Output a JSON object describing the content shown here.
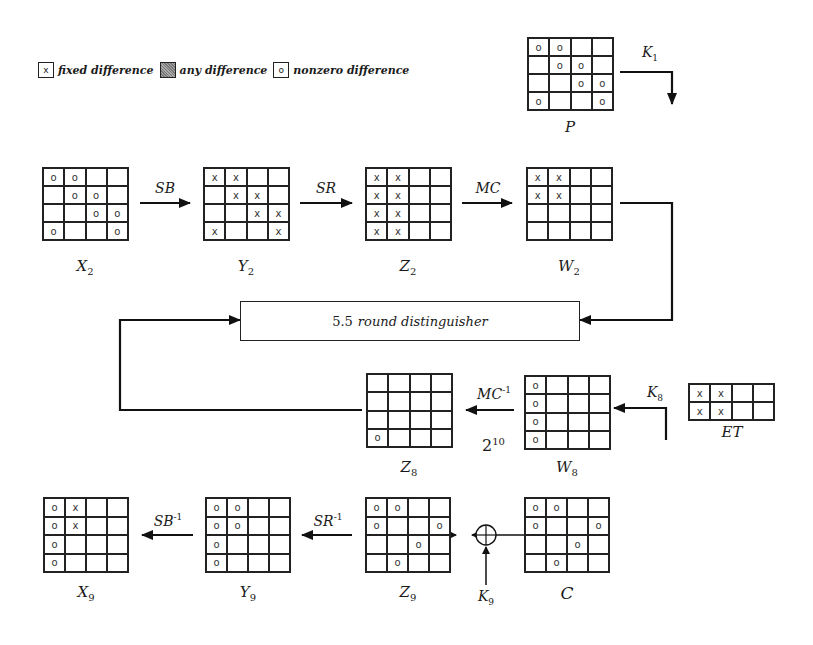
{
  "legend": [
    {
      "symbol": "x",
      "kind": "fixed",
      "label": "fixed difference"
    },
    {
      "symbol": "",
      "kind": "any",
      "label": "any difference"
    },
    {
      "symbol": "o",
      "kind": "nonzero",
      "label": "nonzero difference"
    }
  ],
  "states": {
    "P": {
      "name": "P",
      "sub": "",
      "cells": [
        [
          "o",
          "o",
          "",
          ""
        ],
        [
          "",
          "o",
          "o",
          ""
        ],
        [
          "",
          "",
          "o",
          "o"
        ],
        [
          "o",
          "",
          "",
          "o"
        ]
      ]
    },
    "X2": {
      "name": "X",
      "sub": "2",
      "cells": [
        [
          "o",
          "o",
          "",
          ""
        ],
        [
          "",
          "o",
          "o",
          ""
        ],
        [
          "",
          "",
          "o",
          "o"
        ],
        [
          "o",
          "",
          "",
          "o"
        ]
      ]
    },
    "Y2": {
      "name": "Y",
      "sub": "2",
      "cells": [
        [
          "x",
          "x",
          "",
          ""
        ],
        [
          "",
          "x",
          "x",
          ""
        ],
        [
          "",
          "",
          "x",
          "x"
        ],
        [
          "x",
          "",
          "",
          "x"
        ]
      ]
    },
    "Z2": {
      "name": "Z",
      "sub": "2",
      "cells": [
        [
          "x",
          "x",
          "",
          ""
        ],
        [
          "x",
          "x",
          "",
          ""
        ],
        [
          "x",
          "x",
          "",
          ""
        ],
        [
          "x",
          "x",
          "",
          ""
        ]
      ]
    },
    "W2": {
      "name": "W",
      "sub": "2",
      "cells": [
        [
          "x",
          "x",
          "",
          ""
        ],
        [
          "x",
          "x",
          "",
          ""
        ],
        [
          "",
          "",
          "",
          ""
        ],
        [
          "",
          "",
          "",
          ""
        ]
      ]
    },
    "Z8": {
      "name": "Z",
      "sub": "8",
      "cells": [
        [
          "",
          "",
          "",
          ""
        ],
        [
          "",
          "",
          "",
          ""
        ],
        [
          "",
          "",
          "",
          ""
        ],
        [
          "o",
          "",
          "",
          ""
        ]
      ]
    },
    "W8": {
      "name": "W",
      "sub": "8",
      "cells": [
        [
          "o",
          "",
          "",
          ""
        ],
        [
          "o",
          "",
          "",
          ""
        ],
        [
          "o",
          "",
          "",
          ""
        ],
        [
          "o",
          "",
          "",
          ""
        ]
      ]
    },
    "ET": {
      "name": "ET",
      "sub": "",
      "cells": [
        [
          "x",
          "x",
          "",
          ""
        ],
        [
          "x",
          "x",
          "",
          ""
        ]
      ]
    },
    "X9": {
      "name": "X",
      "sub": "9",
      "cells": [
        [
          "o",
          "x",
          "",
          ""
        ],
        [
          "o",
          "x",
          "",
          ""
        ],
        [
          "o",
          "",
          "",
          ""
        ],
        [
          "o",
          "",
          "",
          ""
        ]
      ]
    },
    "Y9": {
      "name": "Y",
      "sub": "9",
      "cells": [
        [
          "o",
          "o",
          "",
          ""
        ],
        [
          "o",
          "o",
          "",
          ""
        ],
        [
          "o",
          "",
          "",
          ""
        ],
        [
          "o",
          "",
          "",
          ""
        ]
      ]
    },
    "Z9": {
      "name": "Z",
      "sub": "9",
      "cells": [
        [
          "o",
          "o",
          "",
          ""
        ],
        [
          "o",
          "",
          "",
          "o"
        ],
        [
          "",
          "",
          "o",
          ""
        ],
        [
          "",
          "o",
          "",
          ""
        ]
      ]
    },
    "C": {
      "name": "C",
      "sub": "",
      "cells": [
        [
          "o",
          "o",
          "",
          ""
        ],
        [
          "o",
          "",
          "",
          "o"
        ],
        [
          "",
          "",
          "o",
          ""
        ],
        [
          "",
          "o",
          "",
          ""
        ]
      ]
    }
  },
  "operations": {
    "sb": {
      "name": "SB",
      "sup": ""
    },
    "sr": {
      "name": "SR",
      "sup": ""
    },
    "mc": {
      "name": "MC",
      "sup": ""
    },
    "mc_inv": {
      "name": "MC",
      "sup": "-1"
    },
    "sr_inv": {
      "name": "SR",
      "sup": "-1"
    },
    "sb_inv": {
      "name": "SB",
      "sup": "-1"
    }
  },
  "keys": {
    "k1": {
      "name": "K",
      "sub": "1"
    },
    "k8": {
      "name": "K",
      "sub": "8"
    },
    "k9": {
      "name": "K",
      "sub": "9"
    }
  },
  "distinguisher": {
    "num": "5.5",
    "text": "round distinguisher"
  },
  "complexity": {
    "base": "2",
    "exp": "10"
  }
}
